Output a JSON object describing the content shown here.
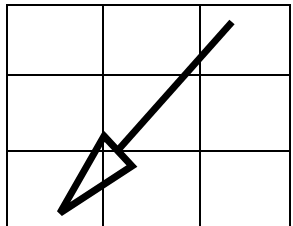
{
  "diagram": {
    "type": "grid-with-arrow",
    "background": "#ffffff",
    "stroke_color": "#000000",
    "grid": {
      "columns": 3,
      "rows": 3,
      "vertical_lines_x": [
        7,
        103,
        200,
        290
      ],
      "horizontal_lines_y": [
        5,
        75,
        151
      ],
      "top": 5,
      "bottom": 226,
      "left": 7,
      "right": 290,
      "line_width": 2
    },
    "arrow": {
      "direction": "down-left",
      "shaft": {
        "x1": 232,
        "y1": 22,
        "x2": 119,
        "y2": 149,
        "width": 7
      },
      "head": {
        "style": "open-triangle",
        "points": [
          [
            104,
            136
          ],
          [
            132,
            166
          ],
          [
            60,
            213
          ]
        ],
        "stroke_width": 7
      }
    }
  }
}
